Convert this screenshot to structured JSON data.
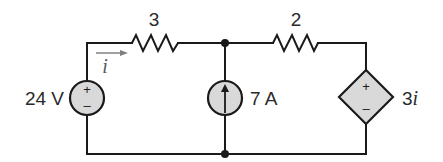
{
  "circuit": {
    "voltage_source": {
      "label": "24 V",
      "plus": "+",
      "minus": "–"
    },
    "resistor_1": {
      "label": "3"
    },
    "resistor_2": {
      "label": "2"
    },
    "current_source": {
      "label": "7 A",
      "direction": "up"
    },
    "dependent_source": {
      "label_coef": "3",
      "label_var": "i",
      "plus": "+",
      "minus": "–"
    },
    "current_label": {
      "var": "i",
      "direction": "right"
    },
    "colors": {
      "wire": "#1a1a1a",
      "source_fill": "#d9d9d9",
      "arrow": "#808080"
    }
  }
}
